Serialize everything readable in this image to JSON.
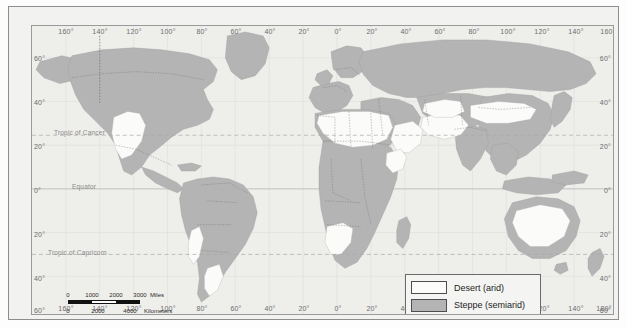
{
  "figure": {
    "type": "world-thematic-map",
    "projection": "cylindrical"
  },
  "map": {
    "ocean_color": "#eeeeeb",
    "land_steppe_color": "#b4b4b4",
    "land_desert_color": "#fbfbf9",
    "border_color": "#7b7b7b",
    "graticule_color": "#cfcfcf"
  },
  "axes": {
    "longitude_top": [
      "160°",
      "140°",
      "120°",
      "100°",
      "80°",
      "60°",
      "40°",
      "20°",
      "0°",
      "20°",
      "40°",
      "60°",
      "80°",
      "100°",
      "120°",
      "140°",
      "160°"
    ],
    "longitude_bottom": [
      "160°",
      "140°",
      "120°",
      "100°",
      "80°",
      "60°",
      "40°",
      "20°",
      "0°",
      "20°",
      "40°",
      "60°",
      "80°",
      "100°",
      "120°",
      "140°",
      "180°"
    ],
    "latitude_left": [
      "60°",
      "40°",
      "20°",
      "0°",
      "20°",
      "40°",
      "60°"
    ],
    "latitude_right": [
      "60°",
      "40°",
      "20°",
      "0°",
      "20°",
      "40°",
      "60°"
    ]
  },
  "reference_lines": [
    {
      "id": "tropic-of-cancer",
      "label": "Tropic of Cancer",
      "style": "dashed"
    },
    {
      "id": "equator",
      "label": "Equator",
      "style": "solid"
    },
    {
      "id": "tropic-of-capricorn",
      "label": "Tropic of Capricorn",
      "style": "dashed"
    }
  ],
  "legend": {
    "items": [
      {
        "id": "desert",
        "label": "Desert (arid)",
        "color": "#fbfbf9"
      },
      {
        "id": "steppe",
        "label": "Steppe (semiarid)",
        "color": "#b4b4b4"
      }
    ]
  },
  "scalebars": [
    {
      "id": "miles",
      "unit": "Miles",
      "ticks": [
        "0",
        "1000",
        "2000",
        "3000"
      ],
      "unit_label": "Miles"
    },
    {
      "id": "kilometers",
      "unit": "Kilometers",
      "ticks": [
        "0",
        "2000",
        "4000"
      ],
      "unit_label": "Kilometers"
    }
  ]
}
